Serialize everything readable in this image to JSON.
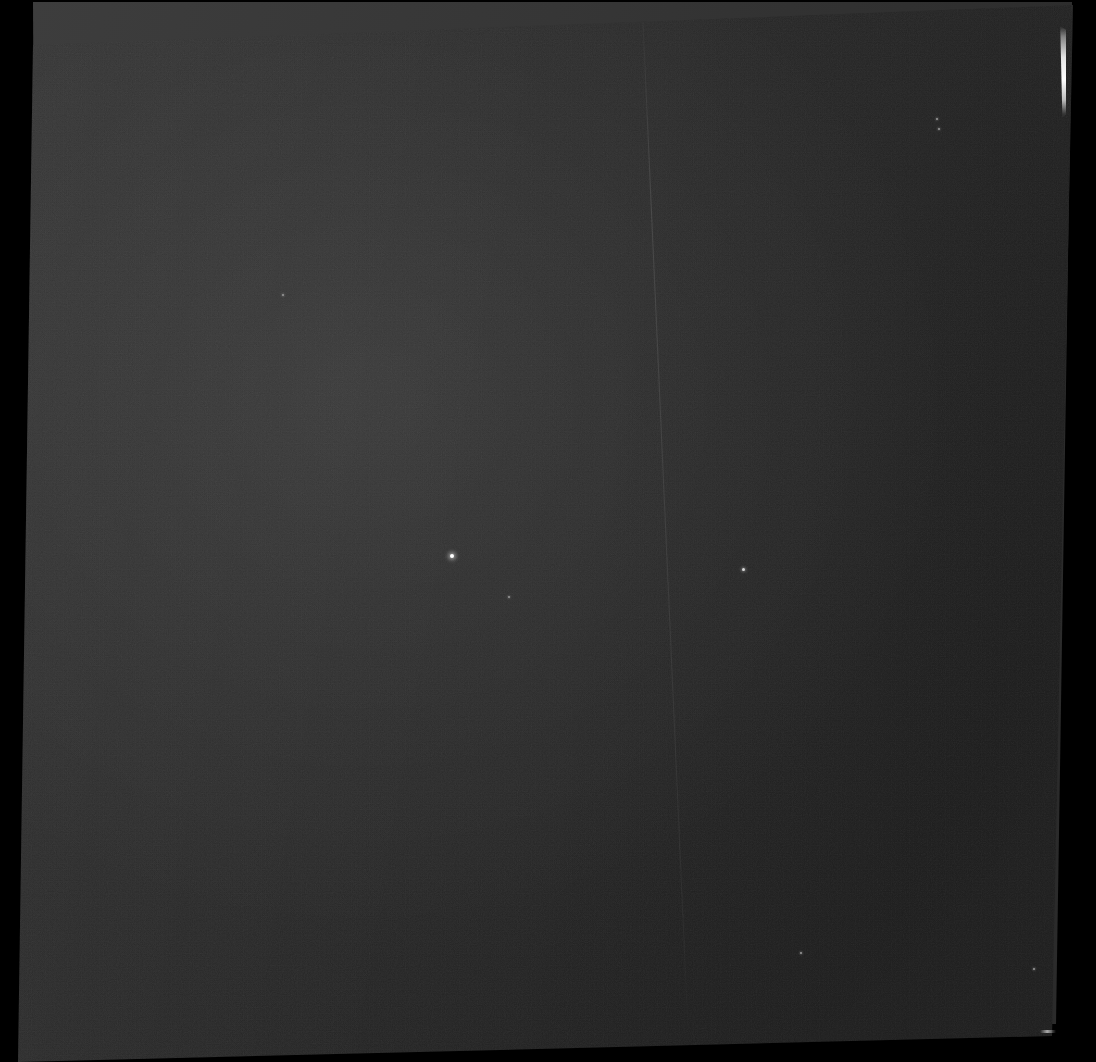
{
  "canvas": {
    "width": 1096,
    "height": 1062,
    "background_color": "#000000",
    "title": "Raw Detector Frame"
  },
  "layers": [
    {
      "name": "back-exposure-layer",
      "label": "Background exposure frame",
      "fill_color": "#3a3a3a",
      "fill_color_secondary": "#303030",
      "opacity": 1,
      "corners": [
        {
          "x": 33,
          "y": 2
        },
        {
          "x": 1072,
          "y": 2
        },
        {
          "x": 1056,
          "y": 1024
        },
        {
          "x": 38,
          "y": 1024
        }
      ]
    },
    {
      "name": "front-exposure-layer",
      "label": "Primary exposure frame",
      "fill_color": "#2c2c2c",
      "fill_color_secondary": "#232323",
      "fill_color_tertiary": "#1f1f1f",
      "opacity": 1,
      "corners": [
        {
          "x": 33,
          "y": 45
        },
        {
          "x": 1073,
          "y": 5
        },
        {
          "x": 1052,
          "y": 1036
        },
        {
          "x": 18,
          "y": 1062
        }
      ]
    }
  ],
  "artifacts": {
    "edge_flare": {
      "name": "saturated-edge-flare",
      "label": "Saturated column bleed at right edge",
      "color": "#ffffff",
      "x": 1056,
      "y": 26,
      "width": 10,
      "height": 92
    },
    "diagonal_scratch": {
      "name": "diagonal-scratch",
      "label": "Faint diagonal scratch trail",
      "color": "#6e6e6e",
      "start": {
        "x": 643,
        "y": 22
      },
      "end": {
        "x": 688,
        "y": 1030
      },
      "stroke_width": 1.1
    },
    "corner_fleck": {
      "name": "corner-fleck",
      "label": "Bright fleck near bottom-right corner",
      "color": "#d7d7d7",
      "x": 1040,
      "y": 1030
    },
    "hot_pixels": [
      {
        "name": "hot-pixel-primary",
        "class": "primary",
        "x": 450,
        "y": 554,
        "color": "#ffffff"
      },
      {
        "name": "hot-pixel-secondary",
        "class": "secondary",
        "x": 742,
        "y": 568,
        "color": "#d8d8d8"
      },
      {
        "name": "hot-pixel-tertiary-a",
        "class": "tertiary",
        "x": 936,
        "y": 118,
        "color": "#9a9a9a"
      },
      {
        "name": "hot-pixel-tertiary-b",
        "class": "tertiary",
        "x": 938,
        "y": 128,
        "color": "#9a9a9a"
      },
      {
        "name": "hot-pixel-tertiary-c",
        "class": "tertiary",
        "x": 508,
        "y": 596,
        "color": "#8e8e8e"
      },
      {
        "name": "hot-pixel-tertiary-d",
        "class": "tertiary",
        "x": 800,
        "y": 952,
        "color": "#8a8a8a"
      },
      {
        "name": "hot-pixel-tertiary-e",
        "class": "tertiary",
        "x": 282,
        "y": 294,
        "color": "#7e7e7e"
      },
      {
        "name": "hot-pixel-tertiary-f",
        "class": "tertiary",
        "x": 1033,
        "y": 968,
        "color": "#8a8a8a"
      }
    ]
  },
  "noise": {
    "grain_label": "sensor read noise grain",
    "column_banding_label": "vertical column fixed-pattern noise",
    "row_striping_label": "horizontal readout row striping",
    "vignette_label": "illumination falloff gradient"
  }
}
